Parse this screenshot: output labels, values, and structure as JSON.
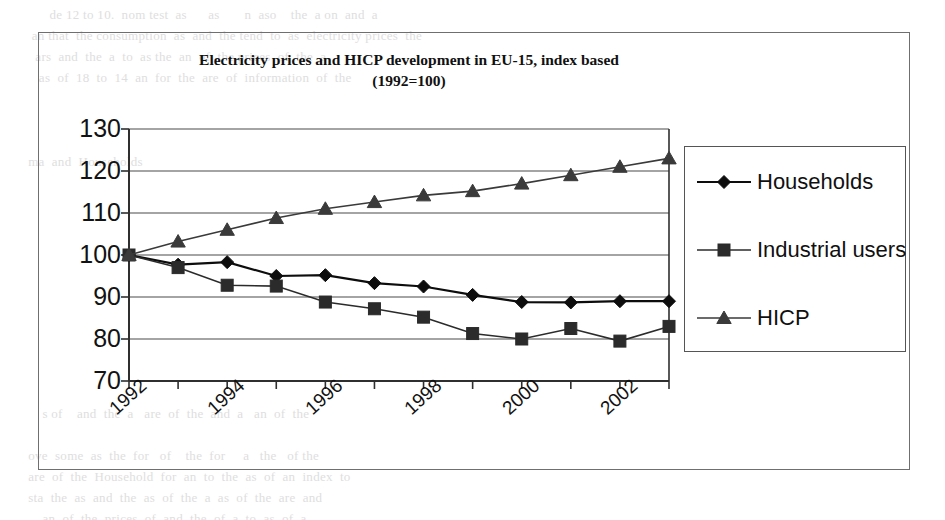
{
  "figure": {
    "title_line1": "Electricity prices and HICP development in EU-15, index based",
    "title_line2": "(1992=100)"
  },
  "legend": {
    "position": "right-outside",
    "items": [
      {
        "label": "Households",
        "marker": "diamond",
        "color": "#0d0d0d"
      },
      {
        "label": "Industrial users",
        "marker": "square",
        "color": "#2b2b2b"
      },
      {
        "label": "HICP",
        "marker": "triangle",
        "color": "#3a3a3a"
      }
    ]
  },
  "axes": {
    "y_ticks": [
      "130",
      "120",
      "110",
      "100",
      "90",
      "80",
      "70"
    ],
    "x_ticks": [
      "1992",
      "1994",
      "1996",
      "1998",
      "2000",
      "2002"
    ],
    "y_min": 70,
    "y_max": 130,
    "y_step": 10
  },
  "background_text": "          de 12 to 10.  nom test  as      as       n  aso    the  a on  and  a\n     an that  the consumption  as  and  the tend  to  as  electricity prices  the\n      ars  and  the  a  to  as the  an  of  the prices  of  the  a\n       as  of  18  to  14  an  for  the  are  of  information  of  the\n\n\n\n    ma  and  Households\n\n\n\n\n\n\n\n\n\n\n\n        s of    and  the  a   are  of  the  and  a   an  of  the\n\n    ove  some  as  the  for   of    the  for     a   the   of the\n    are  of  the  Household  for  an  to  the  as  of  an  index  to\n    sta  the  as  and  the  as  of  the  a  as  of  the  are  and\n        an  of  the  prices  of  and  the  of  a  to  as  of  a",
  "chart_data": {
    "type": "line",
    "title": "Electricity prices and HICP development in EU-15, index based (1992=100)",
    "xlabel": "",
    "ylabel": "",
    "x": [
      1992,
      1993,
      1994,
      1995,
      1996,
      1997,
      1998,
      1999,
      2000,
      2001,
      2002,
      2003
    ],
    "xlim": [
      1992,
      2003
    ],
    "ylim": [
      70,
      130
    ],
    "y_ticks": [
      70,
      80,
      90,
      100,
      110,
      120,
      130
    ],
    "x_tick_labels": [
      "1992",
      "1994",
      "1996",
      "1998",
      "2000",
      "2002"
    ],
    "grid": "horizontal",
    "legend_position": "right",
    "series": [
      {
        "name": "Households",
        "marker": "diamond",
        "color": "#0d0d0d",
        "values": [
          100,
          97.7,
          98.3,
          95.0,
          95.2,
          93.3,
          92.5,
          90.5,
          88.8,
          88.7,
          89.0,
          89.0
        ]
      },
      {
        "name": "Industrial users",
        "marker": "square",
        "color": "#2b2b2b",
        "values": [
          100,
          97.0,
          92.8,
          92.6,
          88.8,
          87.2,
          85.2,
          81.3,
          80.0,
          82.5,
          79.5,
          83.0
        ]
      },
      {
        "name": "HICP",
        "marker": "triangle",
        "color": "#3a3a3a",
        "values": [
          100,
          103.2,
          106.0,
          108.8,
          111.0,
          112.6,
          114.2,
          115.2,
          117.0,
          119.0,
          121.0,
          123.0
        ]
      }
    ]
  }
}
